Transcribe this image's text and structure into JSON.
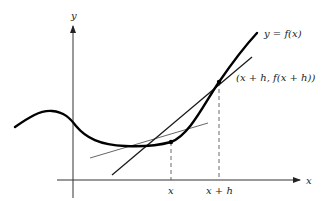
{
  "diagram": {
    "axes": {
      "x_label": "x",
      "y_label": "y"
    },
    "curve_label": "y = f(x)",
    "point_label": "(x + h, f(x + h))",
    "ticks": {
      "x": "x",
      "x_plus_h": "x + h"
    },
    "colors": {
      "curve": "#000000",
      "secant": "#1a1a1a",
      "tangent": "#666666",
      "axis": "#333333"
    }
  }
}
